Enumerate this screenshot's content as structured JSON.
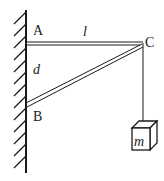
{
  "diagram": {
    "labels": {
      "A": "A",
      "B": "B",
      "C": "C",
      "l": "l",
      "d": "d",
      "m": "m"
    },
    "components": {
      "wall": "hatched vertical wall",
      "rod_AC": "horizontal rod from A to C",
      "strut_BC": "diagonal strut from B to C",
      "rope": "vertical string from C",
      "mass": "cube block labeled m"
    },
    "colors": {
      "ink": "#1a1a1a",
      "background": "#ffffff"
    }
  }
}
